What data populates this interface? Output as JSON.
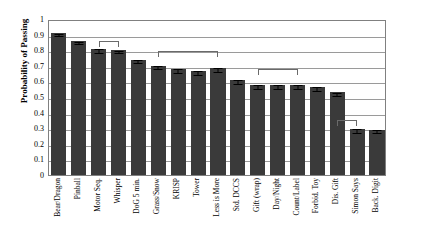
{
  "chart_data": {
    "type": "bar",
    "title": "",
    "xlabel": "",
    "ylabel": "Probability of Passing",
    "ylim": [
      0,
      1
    ],
    "ytick_labels": [
      "0",
      "0.1",
      "0.2",
      "0.3",
      "0.4",
      "0.5",
      "0.6",
      "0.7",
      "0.8",
      "0.9",
      "1"
    ],
    "ytick_values": [
      0,
      0.1,
      0.2,
      0.3,
      0.4,
      0.5,
      0.6,
      0.7,
      0.8,
      0.9,
      1
    ],
    "grid": true,
    "legend": "none",
    "categories": [
      "Bear/Dragon",
      "Pinball",
      "Motor Seq.",
      "Whisper",
      "DoG 5 min.",
      "Grass/Snow",
      "KRISP",
      "Tower",
      "Less is More",
      "Std. DCCS",
      "Gift (wrap)",
      "Day/Night",
      "Count/Label",
      "Forbid. Toy",
      "Dis. Gift",
      "Simon Says",
      "Back. Digit"
    ],
    "values": [
      0.91,
      0.86,
      0.81,
      0.8,
      0.74,
      0.7,
      0.68,
      0.665,
      0.685,
      0.61,
      0.575,
      0.575,
      0.575,
      0.565,
      0.53,
      0.295,
      0.29
    ],
    "errors": [
      0.008,
      0.008,
      0.012,
      0.008,
      0.008,
      0.01,
      0.012,
      0.012,
      0.012,
      0.014,
      0.012,
      0.012,
      0.012,
      0.012,
      0.01,
      0.01,
      0.01
    ],
    "bar_color": "#3a3a3a",
    "annotations": [
      {
        "type": "bracket",
        "from_index": 2,
        "to_index": 3,
        "y": 0.87
      },
      {
        "type": "bracket",
        "from_index": 5,
        "to_index": 8,
        "y": 0.805
      },
      {
        "type": "bracket",
        "from_index": 10,
        "to_index": 12,
        "y": 0.69
      },
      {
        "type": "bracket",
        "from_index": 14,
        "to_index": 15,
        "y": 0.365
      }
    ]
  }
}
